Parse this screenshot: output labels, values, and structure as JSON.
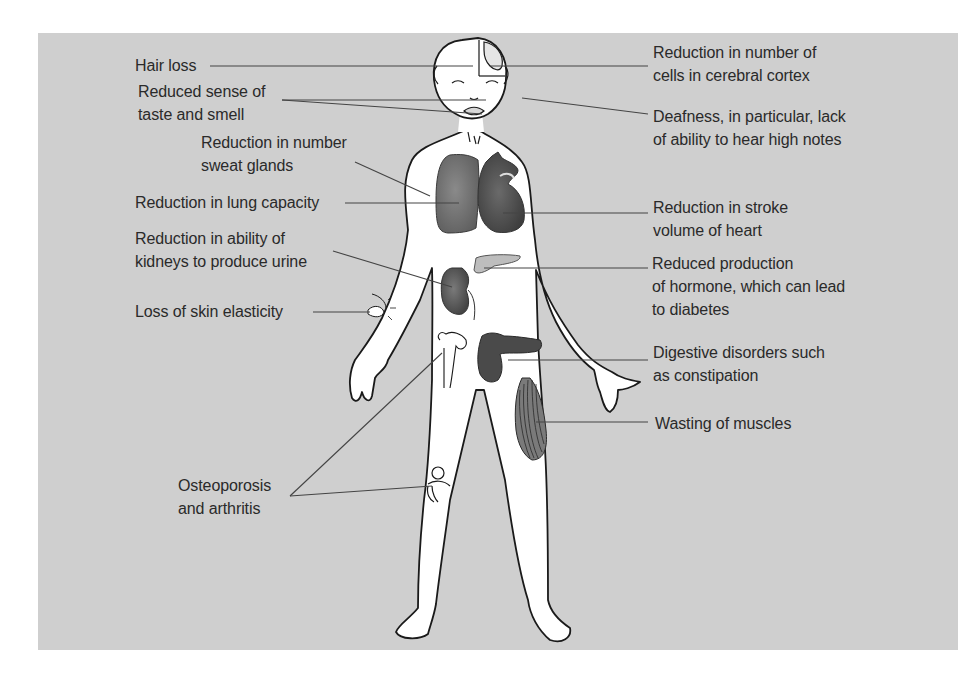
{
  "diagram": {
    "title": "",
    "colors": {
      "background": "#ffffff",
      "panel": "#cfcfcf",
      "text": "#2a2a2a",
      "leader_line": "#444444",
      "organ_dark": "#5a5a5a",
      "organ_mid": "#7a7a7a",
      "organ_light": "#bdbdbd"
    },
    "labels_left": [
      {
        "id": "hair-loss",
        "lines": [
          "Hair loss"
        ],
        "target": "scalp"
      },
      {
        "id": "taste-smell",
        "lines": [
          "Reduced sense of",
          "taste and smell"
        ],
        "target": "nose and mouth"
      },
      {
        "id": "sweat-glands",
        "lines": [
          "Reduction in number",
          "sweat glands"
        ],
        "target": "chest skin"
      },
      {
        "id": "lung-capacity",
        "lines": [
          "Reduction in lung capacity"
        ],
        "target": "lung"
      },
      {
        "id": "kidneys",
        "lines": [
          "Reduction in ability of",
          "kidneys to produce urine"
        ],
        "target": "kidney"
      },
      {
        "id": "skin-elasticity",
        "lines": [
          "Loss of skin elasticity"
        ],
        "target": "pinched skin on arm"
      },
      {
        "id": "osteoporosis",
        "lines": [
          "Osteoporosis",
          "and arthritis"
        ],
        "target": "femur and knee joint"
      }
    ],
    "labels_right": [
      {
        "id": "cerebral-cortex",
        "lines": [
          "Reduction in number of",
          "cells in cerebral cortex"
        ],
        "target": "brain"
      },
      {
        "id": "deafness",
        "lines": [
          "Deafness, in particular, lack",
          "of ability to hear high notes"
        ],
        "target": "ear"
      },
      {
        "id": "stroke-volume",
        "lines": [
          "Reduction in stroke",
          "volume of heart"
        ],
        "target": "heart"
      },
      {
        "id": "hormone",
        "lines": [
          "Reduced production",
          "of hormone, which can lead",
          "to diabetes"
        ],
        "target": "pancreas"
      },
      {
        "id": "digestive",
        "lines": [
          "Digestive disorders such",
          "as constipation"
        ],
        "target": "colon"
      },
      {
        "id": "muscles",
        "lines": [
          "Wasting of muscles"
        ],
        "target": "thigh muscle"
      }
    ]
  }
}
